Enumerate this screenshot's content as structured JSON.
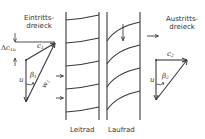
{
  "diagram": {
    "type": "turbine-stage-velocity-triangles",
    "inlet": {
      "title_line1": "Eintritts-",
      "title_line2": "dreieck",
      "labels": {
        "delta_c": "Δc",
        "delta_c_sub": "1u",
        "c": "c",
        "c_sub": "1",
        "u": "u",
        "beta": "β",
        "beta_sub": "1",
        "w": "w",
        "w_sub": "1"
      }
    },
    "outlet": {
      "title_line1": "Austritts-",
      "title_line2": "dreieck",
      "labels": {
        "c": "c",
        "c_sub": "2",
        "u": "u",
        "beta": "β",
        "beta_sub": "2"
      }
    },
    "stator_label": "Leitrad",
    "rotor_label": "Laufrad",
    "stroke_color": "#3a3a3a",
    "background": "#ffffff"
  }
}
